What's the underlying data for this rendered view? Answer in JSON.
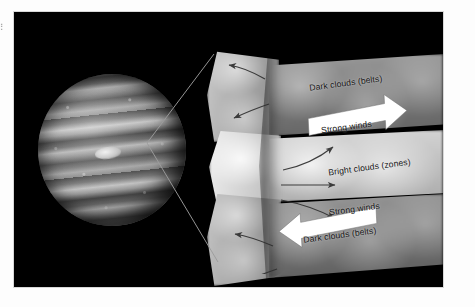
{
  "figure": {
    "background_color": "#ffffff",
    "panel_color": "#000000"
  },
  "planet": {
    "name": "jupiter",
    "feature": "great-red-spot",
    "rendering": "grayscale banded disk"
  },
  "callouts": [
    {
      "name": "callout-line-upper"
    },
    {
      "name": "callout-line-lower"
    }
  ],
  "labels": {
    "dark_clouds_top": "Dark clouds (belts)",
    "strong_winds_top": "Strong winds",
    "bright_clouds": "Bright clouds (zones)",
    "strong_winds_bottom": "Strong winds",
    "dark_clouds_bottom": "Dark clouds (belts)"
  },
  "arrows": {
    "white_top_direction": "right",
    "white_bottom_direction": "left",
    "flow_top_left": [
      "up-left",
      "down-left"
    ],
    "flow_middle": [
      "up-right",
      "right",
      "down-right"
    ],
    "flow_bottom_left": [
      "up-left",
      "down-left"
    ]
  },
  "colors": {
    "panel": "#000000",
    "label_text": "#161616",
    "white_arrow": "#ffffff",
    "flow_arrow": "#2f2f2f",
    "callout_line": "#9a9a9a"
  },
  "edge_artifact": "⣿"
}
